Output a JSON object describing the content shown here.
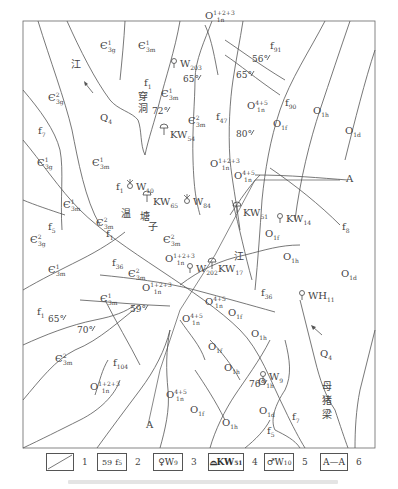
{
  "map": {
    "units": [
      {
        "id": "u1",
        "base": "Є",
        "sup": "1",
        "sub": "3g",
        "x": 100,
        "y": 49
      },
      {
        "id": "u2",
        "base": "Є",
        "sup": "1",
        "sub": "3m",
        "x": 138,
        "y": 49
      },
      {
        "id": "u3",
        "base": "Є",
        "sup": "2",
        "sub": "3g",
        "x": 48,
        "y": 101
      },
      {
        "id": "u4",
        "base": "Є",
        "sup": "1",
        "sub": "3m",
        "x": 161,
        "y": 97
      },
      {
        "id": "u5",
        "base": "Є",
        "sup": "2",
        "sub": "3m",
        "x": 188,
        "y": 124
      },
      {
        "id": "u6",
        "base": "Є",
        "sup": "1",
        "sub": "3g",
        "x": 37,
        "y": 166
      },
      {
        "id": "u7",
        "base": "Є",
        "sup": "1",
        "sub": "3m",
        "x": 92,
        "y": 166
      },
      {
        "id": "u8",
        "base": "Є",
        "sup": "1",
        "sub": "3m",
        "x": 63,
        "y": 208
      },
      {
        "id": "u9",
        "base": "Є",
        "sup": "2",
        "sub": "3m",
        "x": 96,
        "y": 226
      },
      {
        "id": "u10",
        "base": "Є",
        "sup": "2",
        "sub": "3g",
        "x": 30,
        "y": 243
      },
      {
        "id": "u11",
        "base": "Є",
        "sup": "1",
        "sub": "3m",
        "x": 48,
        "y": 273
      },
      {
        "id": "u12",
        "base": "Є",
        "sup": "2",
        "sub": "3m",
        "x": 163,
        "y": 243
      },
      {
        "id": "u13",
        "base": "Є",
        "sup": "2",
        "sub": "3m",
        "x": 128,
        "y": 277
      },
      {
        "id": "u14",
        "base": "Є",
        "sup": "1",
        "sub": "3m",
        "x": 100,
        "y": 302
      },
      {
        "id": "u15",
        "base": "Є",
        "sup": "2",
        "sub": "3m",
        "x": 55,
        "y": 362
      },
      {
        "id": "u16",
        "base": "O",
        "sup": "1+2+3",
        "sub": "1n",
        "x": 205,
        "y": 19
      },
      {
        "id": "u17",
        "base": "O",
        "sup": "4+5",
        "sub": "1n",
        "x": 247,
        "y": 109
      },
      {
        "id": "u18",
        "base": "O",
        "sup": "1+2+3",
        "sub": "1n",
        "x": 210,
        "y": 167
      },
      {
        "id": "u19",
        "base": "O",
        "sup": "4+5",
        "sub": "1n",
        "x": 234,
        "y": 179
      },
      {
        "id": "u20",
        "base": "O",
        "sup": "1+2+3",
        "sub": "1n",
        "x": 165,
        "y": 262
      },
      {
        "id": "u21",
        "base": "O",
        "sup": "1+2+3",
        "sub": "1n",
        "x": 142,
        "y": 291
      },
      {
        "id": "u22",
        "base": "O",
        "sup": "4+5",
        "sub": "1n",
        "x": 205,
        "y": 305
      },
      {
        "id": "u23",
        "base": "O",
        "sup": "4+5",
        "sub": "1n",
        "x": 182,
        "y": 322
      },
      {
        "id": "u24",
        "base": "O",
        "sup": "1+2+3",
        "sub": "1n",
        "x": 90,
        "y": 390
      },
      {
        "id": "u25",
        "base": "O",
        "sup": "4+5",
        "sub": "1n",
        "x": 166,
        "y": 398
      },
      {
        "id": "u26",
        "base": "O",
        "sup": "",
        "sub": "1f",
        "x": 273,
        "y": 127
      },
      {
        "id": "u27",
        "base": "O",
        "sup": "",
        "sub": "1h",
        "x": 313,
        "y": 114
      },
      {
        "id": "u28",
        "base": "O",
        "sup": "",
        "sub": "1d",
        "x": 345,
        "y": 134
      },
      {
        "id": "u29",
        "base": "O",
        "sup": "",
        "sub": "1f",
        "x": 265,
        "y": 237
      },
      {
        "id": "u30",
        "base": "O",
        "sup": "",
        "sub": "1h",
        "x": 283,
        "y": 260
      },
      {
        "id": "u31",
        "base": "O",
        "sup": "",
        "sub": "1d",
        "x": 341,
        "y": 277
      },
      {
        "id": "u32",
        "base": "O",
        "sup": "",
        "sub": "1f",
        "x": 228,
        "y": 316
      },
      {
        "id": "u33",
        "base": "O",
        "sup": "",
        "sub": "1h",
        "x": 251,
        "y": 337
      },
      {
        "id": "u34",
        "base": "O",
        "sup": "",
        "sub": "1f",
        "x": 208,
        "y": 350
      },
      {
        "id": "u35",
        "base": "O",
        "sup": "",
        "sub": "1h",
        "x": 224,
        "y": 371
      },
      {
        "id": "u36",
        "base": "O",
        "sup": "",
        "sub": "1f",
        "x": 190,
        "y": 413
      },
      {
        "id": "u37",
        "base": "O",
        "sup": "",
        "sub": "1h",
        "x": 222,
        "y": 426
      },
      {
        "id": "u38",
        "base": "O",
        "sup": "",
        "sub": "1d",
        "x": 259,
        "y": 414
      },
      {
        "id": "u39",
        "base": "O",
        "sup": "",
        "sub": "1h",
        "x": 258,
        "y": 385
      }
    ],
    "quaternary": [
      {
        "text": "Q",
        "sub": "4",
        "x": 100,
        "y": 121
      },
      {
        "text": "Q",
        "sub": "4",
        "x": 320,
        "y": 357
      }
    ],
    "faults": [
      {
        "text": "f",
        "sub": "91",
        "x": 270,
        "y": 49
      },
      {
        "text": "f",
        "sub": "90",
        "x": 285,
        "y": 106
      },
      {
        "text": "f",
        "sub": "1",
        "x": 144,
        "y": 86
      },
      {
        "text": "f",
        "sub": "47",
        "x": 216,
        "y": 120
      },
      {
        "text": "f",
        "sub": "7",
        "x": 38,
        "y": 134
      },
      {
        "text": "f",
        "sub": "1",
        "x": 116,
        "y": 190
      },
      {
        "text": "f",
        "sub": "5",
        "x": 48,
        "y": 230
      },
      {
        "text": "f",
        "sub": "1",
        "x": 106,
        "y": 237
      },
      {
        "text": "f",
        "sub": "36",
        "x": 112,
        "y": 266
      },
      {
        "text": "f",
        "sub": "8",
        "x": 342,
        "y": 230
      },
      {
        "text": "f",
        "sub": "36",
        "x": 261,
        "y": 296
      },
      {
        "text": "f",
        "sub": "1",
        "x": 37,
        "y": 315
      },
      {
        "text": "f",
        "sub": "104",
        "x": 113,
        "y": 366
      },
      {
        "text": "f",
        "sub": "7",
        "x": 292,
        "y": 420
      },
      {
        "text": "f",
        "sub": "5",
        "x": 267,
        "y": 434
      }
    ],
    "dips": [
      {
        "text": "65°",
        "x": 183,
        "y": 82
      },
      {
        "text": "72°",
        "x": 152,
        "y": 114
      },
      {
        "text": "56°",
        "x": 252,
        "y": 62
      },
      {
        "text": "65°",
        "x": 236,
        "y": 78
      },
      {
        "text": "80°",
        "x": 236,
        "y": 137
      },
      {
        "text": "59°",
        "x": 130,
        "y": 312
      },
      {
        "text": "65°",
        "x": 48,
        "y": 322
      },
      {
        "text": "70°",
        "x": 77,
        "y": 333
      },
      {
        "text": "76°",
        "x": 249,
        "y": 387
      }
    ],
    "wells": [
      {
        "type": "spring",
        "label": "W",
        "sub": "203",
        "x": 180,
        "y": 67
      },
      {
        "type": "cave",
        "label": "KW",
        "sub": "54",
        "x": 170,
        "y": 138
      },
      {
        "type": "ascend",
        "label": "W",
        "sub": "10",
        "x": 136,
        "y": 190
      },
      {
        "type": "cave",
        "label": "KW",
        "sub": "65",
        "x": 153,
        "y": 205
      },
      {
        "type": "ascend",
        "label": "W",
        "sub": "84",
        "x": 193,
        "y": 205
      },
      {
        "type": "cave",
        "label": "KW",
        "sub": "51",
        "x": 243,
        "y": 216
      },
      {
        "type": "spring",
        "label": "KW",
        "sub": "14",
        "x": 286,
        "y": 222
      },
      {
        "type": "spring",
        "label": "W",
        "sub": "202",
        "x": 196,
        "y": 272
      },
      {
        "type": "cave",
        "label": "KW",
        "sub": "17",
        "x": 218,
        "y": 272
      },
      {
        "type": "spring",
        "label": "WH",
        "sub": "11",
        "x": 308,
        "y": 299
      },
      {
        "type": "spring",
        "label": "W",
        "sub": "9",
        "x": 269,
        "y": 380
      }
    ],
    "place_names": [
      {
        "text": "江",
        "x": 71,
        "y": 68
      },
      {
        "text": "穿",
        "x": 138,
        "y": 100
      },
      {
        "text": "洞",
        "x": 138,
        "y": 112
      },
      {
        "text": "温",
        "x": 121,
        "y": 217
      },
      {
        "text": "塘",
        "x": 140,
        "y": 220
      },
      {
        "text": "子",
        "x": 148,
        "y": 230
      },
      {
        "text": "江",
        "x": 234,
        "y": 260
      },
      {
        "text": "母",
        "x": 322,
        "y": 390
      },
      {
        "text": "猪",
        "x": 322,
        "y": 404
      },
      {
        "text": "梁",
        "x": 322,
        "y": 418
      }
    ],
    "section": [
      {
        "text": "A",
        "x": 346,
        "y": 182
      },
      {
        "text": "A",
        "x": 146,
        "y": 428
      }
    ],
    "xin_special": {
      "label": "Є",
      "sup": "2",
      "sub": "3m",
      "x": 188,
      "y": 123
    }
  },
  "legend": {
    "items": [
      {
        "num": "1",
        "content": ""
      },
      {
        "num": "2",
        "content": "59",
        "fault": "f",
        "fault_sub": "5"
      },
      {
        "num": "3",
        "content": "W",
        "sub": "9"
      },
      {
        "num": "4",
        "content": "KW",
        "sub": "51"
      },
      {
        "num": "5",
        "content": "W",
        "sub": "10"
      },
      {
        "num": "6",
        "content": "A—A"
      }
    ]
  },
  "caption": {
    "text": ""
  }
}
